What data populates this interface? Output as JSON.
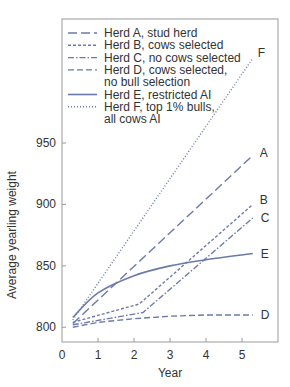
{
  "chart_data": {
    "type": "line",
    "title": "",
    "xlabel": "Year",
    "ylabel": "Average yearling weight",
    "xlim": [
      0,
      6
    ],
    "ylim": [
      788,
      1051
    ],
    "xticks": [
      0,
      1,
      2,
      3,
      4,
      5
    ],
    "xtick_labels": [
      "0",
      "1",
      "2",
      "3",
      "4",
      "5"
    ],
    "yticks": [
      800,
      850,
      900,
      950
    ],
    "ytick_labels": [
      "800",
      "850",
      "900",
      "950"
    ],
    "grid": false,
    "legend_position": "top-left",
    "line_color": "#6b7aa8",
    "series": [
      {
        "key": "A",
        "name": "Herd A, stud herd",
        "style": "long-dash",
        "x": [
          0.3,
          5.3
        ],
        "y": [
          803,
          940
        ]
      },
      {
        "key": "B",
        "name": "Herd B, cows selected",
        "style": "short-dash",
        "x": [
          0.3,
          2.15,
          5.3
        ],
        "y": [
          804,
          819,
          900
        ]
      },
      {
        "key": "C",
        "name": "Herd C, no cows selected",
        "style": "dash-dot",
        "x": [
          0.3,
          2.25,
          5.3
        ],
        "y": [
          802,
          812,
          889
        ]
      },
      {
        "key": "D",
        "name": "Herd D, cows selected, no bull selection",
        "style": "dash",
        "x": [
          0.3,
          1.0,
          2.0,
          3.0,
          4.0,
          5.3
        ],
        "y": [
          800,
          804,
          807,
          809,
          810,
          810
        ]
      },
      {
        "key": "E",
        "name": "Herd E, restricted AI",
        "style": "solid",
        "x": [
          0.3,
          1.0,
          2.0,
          3.0,
          4.0,
          5.3
        ],
        "y": [
          808,
          828,
          842,
          850,
          855,
          860
        ]
      },
      {
        "key": "F",
        "name": "Herd F, top 1% bulls, all cows AI",
        "style": "dotted",
        "x": [
          0.3,
          5.3
        ],
        "y": [
          806,
          1019
        ]
      }
    ],
    "legend": [
      {
        "key": "A",
        "lines": [
          "Herd A, stud herd"
        ]
      },
      {
        "key": "B",
        "lines": [
          "Herd B, cows selected"
        ]
      },
      {
        "key": "C",
        "lines": [
          "Herd C, no cows selected"
        ]
      },
      {
        "key": "D",
        "lines": [
          "Herd D, cows selected,",
          "no bull selection"
        ]
      },
      {
        "key": "E",
        "lines": [
          "Herd E, restricted AI"
        ]
      },
      {
        "key": "F",
        "lines": [
          "Herd F, top 1% bulls,",
          "all cows AI"
        ]
      }
    ],
    "end_labels": [
      "A",
      "B",
      "C",
      "D",
      "E",
      "F"
    ]
  }
}
